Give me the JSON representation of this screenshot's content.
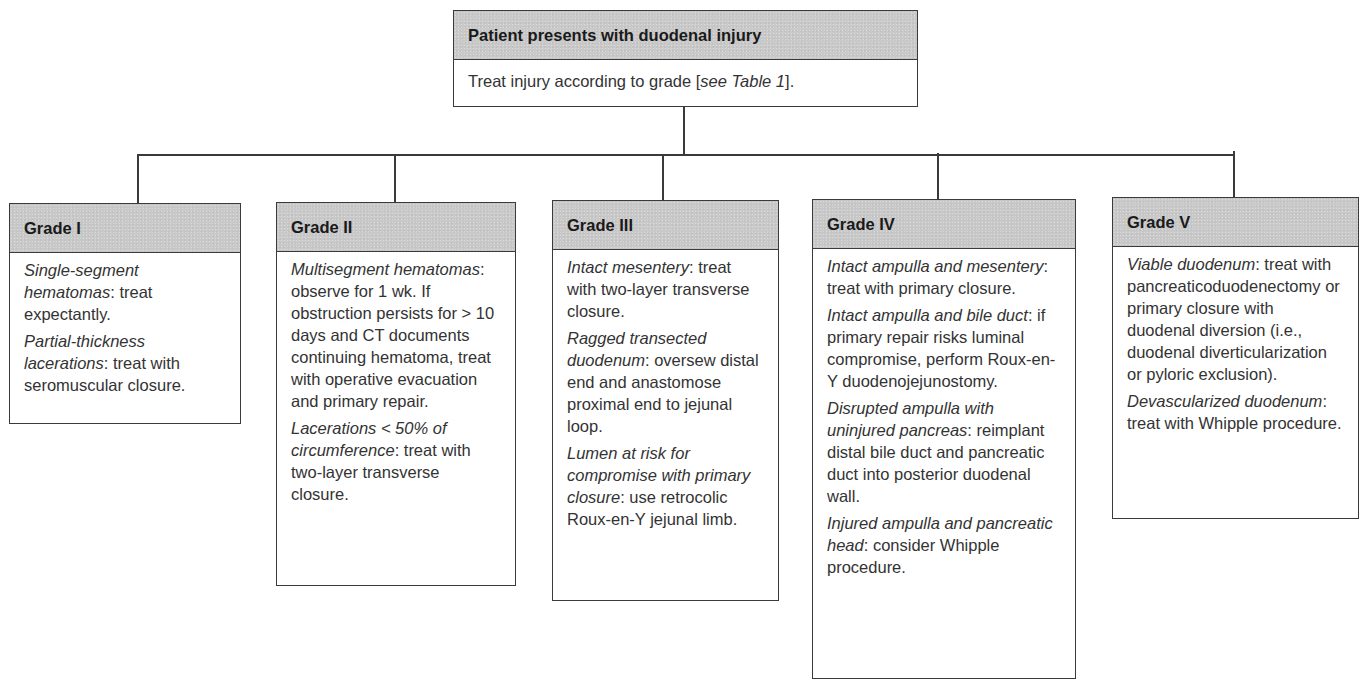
{
  "root": {
    "title": "Patient presents with duodenal injury",
    "body_prefix": "Treat injury according to grade [",
    "body_italic": "see Table 1",
    "body_suffix": "]."
  },
  "grades": [
    {
      "title": "Grade I",
      "paragraphs": [
        {
          "italic": "Single-segment hematomas",
          "text": ": treat expectantly."
        },
        {
          "italic": "Partial-thickness lacerations",
          "text": ": treat with seromuscular closure."
        }
      ]
    },
    {
      "title": "Grade II",
      "paragraphs": [
        {
          "italic": "Multisegment hematomas",
          "text": ": observe for 1 wk. If obstruction persists for > 10 days and CT documents continuing hematoma, treat with operative evacuation and primary repair."
        },
        {
          "italic": "Lacerations < 50% of circumference",
          "text": ": treat with two-layer transverse closure."
        }
      ]
    },
    {
      "title": "Grade III",
      "paragraphs": [
        {
          "italic": "Intact mesentery",
          "text": ": treat with two-layer transverse closure."
        },
        {
          "italic": "Ragged transected duodenum",
          "text": ": oversew distal end and anastomose proximal end to jejunal loop."
        },
        {
          "italic": "Lumen at risk for compromise with primary closure",
          "text": ": use retrocolic Roux-en-Y jejunal limb."
        }
      ]
    },
    {
      "title": "Grade IV",
      "paragraphs": [
        {
          "italic": "Intact ampulla and mesentery",
          "text": ": treat with primary closure."
        },
        {
          "italic": "Intact ampulla and bile duct",
          "text": ": if primary repair risks luminal compromise, perform Roux-en-Y duodenojejunostomy."
        },
        {
          "italic": "Disrupted ampulla with uninjured pancreas",
          "text": ": reimplant distal bile duct and pancreatic duct into posterior duodenal wall."
        },
        {
          "italic": "Injured ampulla and pancreatic head",
          "text": ": consider Whipple procedure."
        }
      ]
    },
    {
      "title": "Grade V",
      "paragraphs": [
        {
          "italic": "Viable duodenum",
          "text": ": treat with pancreaticoduodenectomy or primary closure with duodenal diversion (i.e., duodenal diverticularization or pyloric exclusion)."
        },
        {
          "italic": "Devascularized duodenum",
          "text": ": treat with Whipple procedure."
        }
      ]
    }
  ],
  "colors": {
    "header_fill": "#c9c9c9",
    "border": "#3a3a3a",
    "text": "#333333"
  }
}
